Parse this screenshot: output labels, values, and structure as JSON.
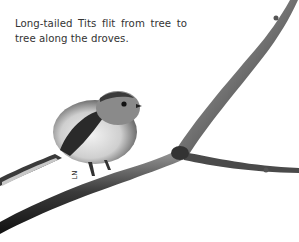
{
  "caption": {
    "line1": "Long-tailed Tits flit from tree to",
    "line2": "tree along the droves."
  },
  "illustration": {
    "subject": "Long-tailed Tit perched on a bare branch",
    "style": "black-and-white photograph"
  },
  "signature": "LN"
}
